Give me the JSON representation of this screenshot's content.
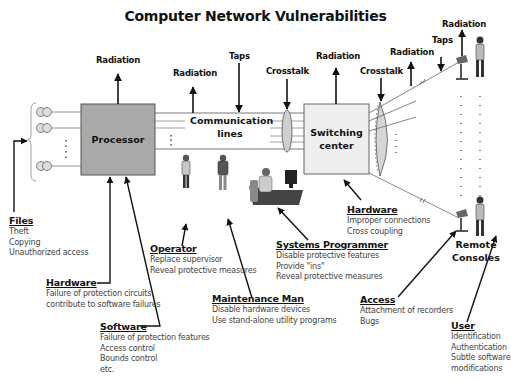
{
  "title": "Computer Network Vulnerabilities",
  "nodes": {
    "processor": "Processor",
    "communication_lines": [
      "Communication",
      "lines"
    ],
    "switching_center": [
      "Switching",
      "center"
    ],
    "remote_consoles": [
      "Remote",
      "Consoles"
    ]
  },
  "threat_labels": {
    "radiation_processor": "Radiation",
    "radiation_lines": "Radiation",
    "taps_lines": "Taps",
    "crosstalk_lines": "Crosstalk",
    "radiation_switching": "Radiation",
    "crosstalk_remote": "Crosstalk",
    "radiation_remote_line": "Radiation",
    "taps_remote": "Taps",
    "radiation_console": "Radiation"
  },
  "categories": {
    "files": {
      "heading": "Files",
      "items": [
        "Theft",
        "Copying",
        "Unauthorized access"
      ]
    },
    "hardware_processor": {
      "heading": "Hardware",
      "items": [
        "Failure of protection circuits",
        "contribute to software failures"
      ]
    },
    "software": {
      "heading": "Software",
      "items": [
        "Failure of protection features",
        "Access control",
        "Bounds control",
        "etc."
      ]
    },
    "operator": {
      "heading": "Operator",
      "items": [
        "Replace supervisor",
        "Reveal protective measures"
      ]
    },
    "maintenance_man": {
      "heading": "Maintenance Man",
      "items": [
        "Disable hardware devices",
        "Use stand-alone utility programs"
      ]
    },
    "systems_programmer": {
      "heading": "Systems Programmer",
      "items": [
        "Disable protective features",
        "Provide \"ins\"",
        "Reveal protective measures"
      ]
    },
    "hardware_switching": {
      "heading": "Hardware",
      "items": [
        "Improper connections",
        "Cross coupling"
      ]
    },
    "access": {
      "heading": "Access",
      "items": [
        "Attachment of recorders",
        "Bugs"
      ]
    },
    "user": {
      "heading": "User",
      "items": [
        "Identification",
        "Authentication",
        "Subtle software",
        "modifications"
      ]
    }
  },
  "colors": {
    "processor_fill": "#a9a9a9",
    "switching_fill": "#eeeeee",
    "line": "#111111",
    "subtext": "#444444"
  }
}
